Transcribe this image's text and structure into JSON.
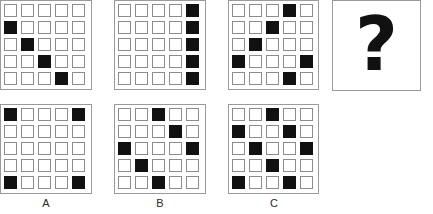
{
  "puzzle": {
    "type": "matrix-reasoning",
    "grid_size": {
      "rows": 5,
      "cols": 5
    },
    "unknown_marker": "?",
    "colors": {
      "filled_cell": "#111111",
      "empty_cell_border": "#8c8c8c",
      "panel_border": "#9a9a9a",
      "background": "#ffffff"
    }
  },
  "sequence": [
    {
      "id": "panel-1",
      "name": "sequence-panel-1",
      "filled": [
        [
          0,
          0,
          0,
          0,
          0
        ],
        [
          1,
          0,
          0,
          0,
          0
        ],
        [
          0,
          1,
          0,
          0,
          0
        ],
        [
          0,
          0,
          1,
          0,
          0
        ],
        [
          0,
          0,
          0,
          1,
          0
        ]
      ]
    },
    {
      "id": "panel-2",
      "name": "sequence-panel-2",
      "filled": [
        [
          0,
          0,
          0,
          0,
          1
        ],
        [
          0,
          0,
          0,
          0,
          1
        ],
        [
          0,
          0,
          0,
          0,
          1
        ],
        [
          0,
          0,
          0,
          0,
          1
        ],
        [
          0,
          0,
          0,
          0,
          1
        ]
      ]
    },
    {
      "id": "panel-3",
      "name": "sequence-panel-3",
      "filled": [
        [
          0,
          0,
          0,
          1,
          0
        ],
        [
          0,
          0,
          1,
          0,
          0
        ],
        [
          0,
          1,
          0,
          0,
          0
        ],
        [
          1,
          0,
          0,
          0,
          1
        ],
        [
          0,
          0,
          0,
          1,
          0
        ]
      ]
    }
  ],
  "question_panel": {
    "id": "question-panel",
    "glyph": "?"
  },
  "options": [
    {
      "id": "option-a",
      "label": "A",
      "filled": [
        [
          1,
          0,
          0,
          0,
          1
        ],
        [
          0,
          0,
          0,
          0,
          0
        ],
        [
          0,
          0,
          0,
          0,
          0
        ],
        [
          0,
          0,
          0,
          0,
          0
        ],
        [
          1,
          0,
          0,
          0,
          1
        ]
      ]
    },
    {
      "id": "option-b",
      "label": "B",
      "filled": [
        [
          0,
          0,
          1,
          0,
          0
        ],
        [
          0,
          0,
          0,
          1,
          0
        ],
        [
          1,
          0,
          0,
          0,
          1
        ],
        [
          0,
          1,
          0,
          0,
          0
        ],
        [
          0,
          0,
          1,
          0,
          0
        ]
      ]
    },
    {
      "id": "option-c",
      "label": "C",
      "filled": [
        [
          0,
          0,
          1,
          0,
          0
        ],
        [
          1,
          0,
          0,
          1,
          0
        ],
        [
          0,
          1,
          0,
          0,
          1
        ],
        [
          0,
          0,
          1,
          0,
          0
        ],
        [
          1,
          0,
          0,
          1,
          0
        ]
      ]
    }
  ]
}
